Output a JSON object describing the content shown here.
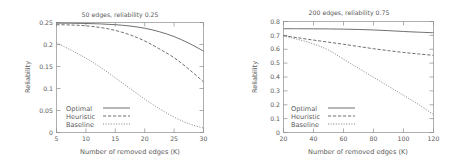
{
  "figure": {
    "panel_count": 2
  },
  "chart_data": [
    {
      "type": "line",
      "title": "50 edges, reliability 0.25",
      "xlabel": "Number of removed edges (K)",
      "ylabel": "Reliability",
      "xlim": [
        5,
        30
      ],
      "ylim": [
        0,
        0.25
      ],
      "xticks": [
        "5",
        "10",
        "15",
        "20",
        "25",
        "30"
      ],
      "yticks": [
        "0",
        "0.05",
        "0.1",
        "0.15",
        "0.2",
        "0.25"
      ],
      "xtick_values": [
        5,
        10,
        15,
        20,
        25,
        30
      ],
      "ytick_values": [
        0,
        0.05,
        0.1,
        0.15,
        0.2,
        0.25
      ],
      "grid": false,
      "legend_position": "bottom-left",
      "x": [
        5,
        7.5,
        10,
        12.5,
        15,
        17.5,
        20,
        22.5,
        25,
        27.5,
        30
      ],
      "series": [
        {
          "name": "Optimal",
          "style": "solid",
          "values": [
            0.2485,
            0.2483,
            0.2478,
            0.2468,
            0.245,
            0.242,
            0.237,
            0.229,
            0.218,
            0.203,
            0.185
          ]
        },
        {
          "name": "Heuristic",
          "style": "dashed",
          "values": [
            0.245,
            0.2443,
            0.2425,
            0.2385,
            0.232,
            0.222,
            0.208,
            0.19,
            0.17,
            0.144,
            0.115
          ]
        },
        {
          "name": "Baseline",
          "style": "dotted",
          "values": [
            0.204,
            0.187,
            0.169,
            0.148,
            0.124,
            0.1,
            0.076,
            0.054,
            0.035,
            0.02,
            0.01
          ]
        }
      ]
    },
    {
      "type": "line",
      "title": "200 edges, reliability 0.75",
      "xlabel": "Number of removed edges (K)",
      "ylabel": "Reliability",
      "xlim": [
        20,
        120
      ],
      "ylim": [
        0,
        0.8
      ],
      "xticks": [
        "20",
        "40",
        "60",
        "80",
        "100",
        "120"
      ],
      "yticks": [
        "0",
        "0.1",
        "0.2",
        "0.3",
        "0.4",
        "0.5",
        "0.6",
        "0.7",
        "0.8"
      ],
      "xtick_values": [
        20,
        40,
        60,
        80,
        100,
        120
      ],
      "ytick_values": [
        0,
        0.1,
        0.2,
        0.3,
        0.4,
        0.5,
        0.6,
        0.7,
        0.8
      ],
      "grid": false,
      "legend_position": "bottom-left",
      "x": [
        20,
        30,
        40,
        50,
        60,
        70,
        80,
        90,
        100,
        110,
        120
      ],
      "series": [
        {
          "name": "Optimal",
          "style": "solid",
          "values": [
            0.748,
            0.7478,
            0.7472,
            0.7465,
            0.745,
            0.7425,
            0.739,
            0.734,
            0.728,
            0.723,
            0.719
          ]
        },
        {
          "name": "Heuristic",
          "style": "dashed",
          "values": [
            0.698,
            0.682,
            0.666,
            0.651,
            0.636,
            0.62,
            0.604,
            0.59,
            0.577,
            0.566,
            0.556
          ]
        },
        {
          "name": "Baseline",
          "style": "dotted",
          "values": [
            0.696,
            0.67,
            0.638,
            0.594,
            0.528,
            0.463,
            0.398,
            0.333,
            0.268,
            0.202,
            0.13
          ]
        }
      ]
    }
  ]
}
